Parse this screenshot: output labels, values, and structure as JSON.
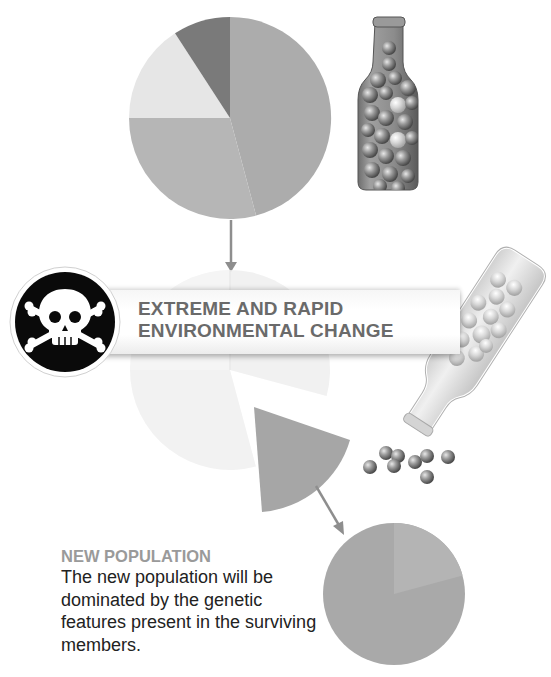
{
  "banner": {
    "line1": "EXTREME AND RAPID",
    "line2": "ENVIRONMENTAL CHANGE",
    "icon": "skull-and-crossbones-icon"
  },
  "caption": {
    "title": "NEW POPULATION",
    "body": "The new population will be dominated by the genetic features present in the surviving members."
  },
  "colors": {
    "slice_large_right": "#acacac",
    "slice_bottom_left": "#b6b6b6",
    "slice_light": "#e6e6e6",
    "slice_dark": "#7a7a7a",
    "banner_text": "#6a6a6a",
    "caption_title": "#9a9a9a",
    "caption_body": "#222222"
  },
  "diagram": {
    "stages": [
      {
        "name": "original-population",
        "slices_deg": [
          [
            0,
            165
          ],
          [
            165,
            270
          ],
          [
            270,
            327
          ],
          [
            327,
            360
          ]
        ]
      },
      {
        "name": "environmental-change",
        "surviving_slice_deg": [
          105,
          165
        ]
      },
      {
        "name": "new-population",
        "slices_deg": [
          [
            0,
            75
          ],
          [
            75,
            360
          ]
        ]
      }
    ]
  }
}
